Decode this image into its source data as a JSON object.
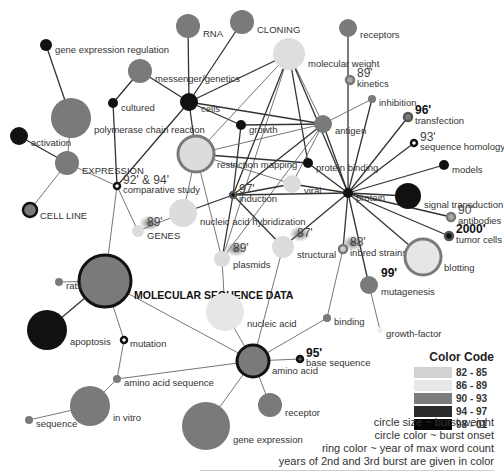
{
  "legend": {
    "title": "Color Code",
    "ranges": [
      {
        "label": "82 - 85",
        "color": "#d2d2d2"
      },
      {
        "label": "86 - 89",
        "color": "#e8e8e8"
      },
      {
        "label": "90 - 93",
        "color": "#7c7c7c"
      },
      {
        "label": "94 - 97",
        "color": "#2a2a2a"
      },
      {
        "label": "98 - 01",
        "color": "#050505"
      }
    ],
    "notes": [
      "circle size ~ burst weight",
      "circle color ~ burst onset",
      "ring color ~ year of max word count",
      "years of 2nd and 3rd burst are given in color"
    ]
  },
  "nodes": [
    {
      "id": "gene-expression-regulation",
      "label": "gene expression regulation",
      "x": 46,
      "y": 45,
      "r": 6,
      "fill": "#111"
    },
    {
      "id": "rna",
      "label": "RNA",
      "x": 188,
      "y": 26,
      "r": 12,
      "fill": "#7a7a7a"
    },
    {
      "id": "cloning",
      "label": "CLONING",
      "x": 242,
      "y": 22,
      "r": 12,
      "fill": "#7a7a7a"
    },
    {
      "id": "receptors",
      "label": "receptors",
      "x": 348,
      "y": 28,
      "r": 9,
      "fill": "#7a7a7a"
    },
    {
      "id": "molecular-weight",
      "label": "molecular weight",
      "x": 289,
      "y": 54,
      "r": 16,
      "fill": "#dedede"
    },
    {
      "id": "messenger-genetics",
      "label": "messenger/genetics",
      "x": 140,
      "y": 71,
      "r": 12,
      "fill": "#7a7a7a"
    },
    {
      "id": "kinetics",
      "label": "kinetics",
      "x": 350,
      "y": 80,
      "r": 4,
      "fill": "#aaa",
      "ring": "#777",
      "year": "89'"
    },
    {
      "id": "cultured",
      "label": "cultured",
      "x": 113,
      "y": 103,
      "r": 5,
      "fill": "#111"
    },
    {
      "id": "cells",
      "label": "cells",
      "x": 189,
      "y": 102,
      "r": 9,
      "fill": "#111"
    },
    {
      "id": "polymerase-chain-reaction",
      "label": "polymerase chain reaction",
      "x": 71,
      "y": 118,
      "r": 20,
      "fill": "#7a7a7a"
    },
    {
      "id": "inhibition",
      "label": "inhibition",
      "x": 372,
      "y": 99,
      "r": 4,
      "fill": "#7a7a7a"
    },
    {
      "id": "growth",
      "label": "growth",
      "x": 241,
      "y": 125,
      "r": 5,
      "fill": "#111"
    },
    {
      "id": "antigen",
      "label": "antigen",
      "x": 323,
      "y": 124,
      "r": 9,
      "fill": "#7a7a7a"
    },
    {
      "id": "activation",
      "label": "activation",
      "x": 19,
      "y": 136,
      "r": 9,
      "fill": "#111"
    },
    {
      "id": "transfection",
      "label": "transfection",
      "x": 408,
      "y": 117,
      "r": 4,
      "fill": "#7a7a7a",
      "ring": "#555",
      "year": "96'",
      "yearBold": true
    },
    {
      "id": "expression",
      "label": "EXPRESSION",
      "x": 67,
      "y": 163,
      "r": 12,
      "fill": "#7a7a7a"
    },
    {
      "id": "restriction-mapping",
      "label": "restriction mapping",
      "x": 196,
      "y": 154,
      "r": 18,
      "fill": "#dcdcdc",
      "ring": "#7a7a7a"
    },
    {
      "id": "sequence-homology",
      "label": "sequence homology",
      "x": 414,
      "y": 143,
      "r": 3,
      "fill": "#fff",
      "ring": "#111",
      "year": "93'"
    },
    {
      "id": "protein-binding",
      "label": "protein binding",
      "x": 308,
      "y": 163,
      "r": 5,
      "fill": "#111"
    },
    {
      "id": "comparative-study",
      "label": "comparative study",
      "x": 117,
      "y": 186,
      "r": 3,
      "fill": "#fff",
      "ring": "#111",
      "year": "92' & 94'"
    },
    {
      "id": "viral",
      "label": "viral",
      "x": 292,
      "y": 184,
      "r": 9,
      "fill": "#dcdcdc"
    },
    {
      "id": "models",
      "label": "models",
      "x": 444,
      "y": 165,
      "r": 5,
      "fill": "#111"
    },
    {
      "id": "induction",
      "label": "induction",
      "x": 233,
      "y": 195,
      "r": 3,
      "fill": "#111",
      "ring": "#555",
      "year": "97'"
    },
    {
      "id": "protein",
      "label": "protein",
      "x": 348,
      "y": 193,
      "r": 5,
      "fill": "#111"
    },
    {
      "id": "signal-transduction",
      "label": "signal transduction",
      "x": 408,
      "y": 196,
      "r": 13,
      "fill": "#111"
    },
    {
      "id": "cell-line",
      "label": "CELL LINE",
      "x": 30,
      "y": 210,
      "r": 7,
      "fill": "#7a7a7a",
      "ring": "#111"
    },
    {
      "id": "nucleic-acid-hybridization",
      "label": "nucleic acid hybridization",
      "x": 183,
      "y": 213,
      "r": 14,
      "fill": "#dcdcdc"
    },
    {
      "id": "antibodies",
      "label": "antibodies",
      "x": 451,
      "y": 217,
      "r": 4,
      "fill": "#aaa",
      "ring": "#777",
      "year": "90'"
    },
    {
      "id": "genes",
      "label": "GENES",
      "x": 138,
      "y": 231,
      "r": 6,
      "fill": "#dcdcdc",
      "year": "89'",
      "glow": true
    },
    {
      "id": "tumor-cells",
      "label": "tumor cells",
      "x": 449,
      "y": 236,
      "r": 4,
      "fill": "#111",
      "ring": "#555",
      "year": "2000'",
      "yearBold": true
    },
    {
      "id": "structural",
      "label": "structural",
      "x": 283,
      "y": 247,
      "r": 11,
      "fill": "#dcdcdc",
      "year": "87'",
      "glow": true
    },
    {
      "id": "inbred-strains",
      "label": "inbred strains",
      "x": 343,
      "y": 249,
      "r": 4,
      "fill": "#ccc",
      "ring": "#777",
      "year": "88'",
      "glow": true
    },
    {
      "id": "blotting",
      "label": "blotting",
      "x": 423,
      "y": 257,
      "r": 18,
      "fill": "#e6e6e6",
      "ring": "#7a7a7a"
    },
    {
      "id": "plasmids",
      "label": "plasmids",
      "x": 222,
      "y": 259,
      "r": 8,
      "fill": "#dcdcdc",
      "year": "89'",
      "glow": true
    },
    {
      "id": "molecular-sequence-data",
      "label": "MOLECULAR SEQUENCE DATA",
      "x": 105,
      "y": 281,
      "r": 26,
      "fill": "#7a7a7a",
      "ring": "#111"
    },
    {
      "id": "rats",
      "label": "rats",
      "x": 59,
      "y": 282,
      "r": 4,
      "fill": "#7a7a7a"
    },
    {
      "id": "mutagenesis",
      "label": "mutagenesis",
      "x": 369,
      "y": 285,
      "r": 9,
      "fill": "#7a7a7a",
      "year": "99'",
      "yearBold": true
    },
    {
      "id": "nucleic-acid",
      "label": "nucleic acid",
      "x": 225,
      "y": 312,
      "r": 19,
      "fill": "#e6e6e6"
    },
    {
      "id": "apoptosis",
      "label": "apoptosis",
      "x": 47,
      "y": 330,
      "r": 20,
      "fill": "#111"
    },
    {
      "id": "binding",
      "label": "binding",
      "x": 327,
      "y": 318,
      "r": 4,
      "fill": "#7a7a7a"
    },
    {
      "id": "mutation",
      "label": "mutation",
      "x": 124,
      "y": 340,
      "r": 3,
      "fill": "#fff",
      "ring": "#111"
    },
    {
      "id": "growth-factor",
      "label": "growth-factor",
      "x": 380,
      "y": 330,
      "r": 3,
      "fill": "#eee"
    },
    {
      "id": "amino-acid",
      "label": "amino acid",
      "x": 253,
      "y": 361,
      "r": 16,
      "fill": "#7a7a7a",
      "ring": "#111"
    },
    {
      "id": "base-sequence",
      "label": "base sequence",
      "x": 300,
      "y": 359,
      "r": 3,
      "fill": "#555",
      "ring": "#111",
      "year": "95'",
      "yearBold": true
    },
    {
      "id": "amino-acid-sequence",
      "label": "amino acid sequence",
      "x": 117,
      "y": 379,
      "r": 4,
      "fill": "#7a7a7a"
    },
    {
      "id": "in-vitro",
      "label": "in vitro",
      "x": 90,
      "y": 406,
      "r": 20,
      "fill": "#7a7a7a"
    },
    {
      "id": "receptor",
      "label": "receptor",
      "x": 270,
      "y": 405,
      "r": 12,
      "fill": "#7a7a7a"
    },
    {
      "id": "sequence",
      "label": "sequence",
      "x": 29,
      "y": 420,
      "r": 4,
      "fill": "#7a7a7a"
    },
    {
      "id": "gene-expression",
      "label": "gene expression",
      "x": 206,
      "y": 426,
      "r": 24,
      "fill": "#7a7a7a"
    }
  ],
  "edges": [
    [
      "gene-expression-regulation",
      "polymerase-chain-reaction"
    ],
    [
      "polymerase-chain-reaction",
      "expression"
    ],
    [
      "activation",
      "expression"
    ],
    [
      "expression",
      "cell-line"
    ],
    [
      "expression",
      "comparative-study"
    ],
    [
      "rna",
      "cells"
    ],
    [
      "cloning",
      "cells"
    ],
    [
      "messenger-genetics",
      "cells"
    ],
    [
      "cultured",
      "messenger-genetics"
    ],
    [
      "cultured",
      "comparative-study"
    ],
    [
      "comparative-study",
      "cells"
    ],
    [
      "comparative-study",
      "genes"
    ],
    [
      "comparative-study",
      "molecular-sequence-data"
    ],
    [
      "cells",
      "molecular-weight"
    ],
    [
      "cells",
      "growth"
    ],
    [
      "cells",
      "antigen"
    ],
    [
      "cells",
      "restriction-mapping"
    ],
    [
      "molecular-weight",
      "restriction-mapping"
    ],
    [
      "molecular-weight",
      "induction"
    ],
    [
      "molecular-weight",
      "plasmids"
    ],
    [
      "molecular-weight",
      "antigen"
    ],
    [
      "molecular-weight",
      "protein"
    ],
    [
      "molecular-weight",
      "protein-binding"
    ],
    [
      "receptors",
      "protein"
    ],
    [
      "inhibition",
      "antigen"
    ],
    [
      "inhibition",
      "protein"
    ],
    [
      "growth",
      "antigen"
    ],
    [
      "growth",
      "induction"
    ],
    [
      "restriction-mapping",
      "antigen"
    ],
    [
      "restriction-mapping",
      "protein-binding"
    ],
    [
      "restriction-mapping",
      "viral"
    ],
    [
      "restriction-mapping",
      "plasmids"
    ],
    [
      "restriction-mapping",
      "nucleic-acid-hybridization"
    ],
    [
      "antigen",
      "protein"
    ],
    [
      "antigen",
      "induction"
    ],
    [
      "antigen",
      "plasmids"
    ],
    [
      "antigen",
      "viral"
    ],
    [
      "protein-binding",
      "protein"
    ],
    [
      "viral",
      "protein"
    ],
    [
      "viral",
      "induction"
    ],
    [
      "induction",
      "protein"
    ],
    [
      "induction",
      "plasmids"
    ],
    [
      "induction",
      "structural"
    ],
    [
      "induction",
      "nucleic-acid-hybridization"
    ],
    [
      "protein",
      "transfection"
    ],
    [
      "protein",
      "sequence-homology"
    ],
    [
      "protein",
      "models"
    ],
    [
      "protein",
      "signal-transduction"
    ],
    [
      "protein",
      "antibodies"
    ],
    [
      "protein",
      "tumor-cells"
    ],
    [
      "protein",
      "blotting"
    ],
    [
      "protein",
      "inbred-strains"
    ],
    [
      "protein",
      "structural"
    ],
    [
      "protein",
      "mutagenesis"
    ],
    [
      "inbred-strains",
      "binding"
    ],
    [
      "genes",
      "nucleic-acid-hybridization"
    ],
    [
      "plasmids",
      "nucleic-acid"
    ],
    [
      "structural",
      "amino-acid"
    ],
    [
      "molecular-sequence-data",
      "rats"
    ],
    [
      "molecular-sequence-data",
      "apoptosis"
    ],
    [
      "molecular-sequence-data",
      "mutation"
    ],
    [
      "molecular-sequence-data",
      "amino-acid"
    ],
    [
      "nucleic-acid",
      "amino-acid"
    ],
    [
      "mutagenesis",
      "growth-factor"
    ],
    [
      "mutation",
      "amino-acid-sequence"
    ],
    [
      "amino-acid",
      "binding"
    ],
    [
      "amino-acid",
      "base-sequence"
    ],
    [
      "amino-acid",
      "amino-acid-sequence"
    ],
    [
      "amino-acid",
      "receptor"
    ],
    [
      "amino-acid",
      "gene-expression"
    ],
    [
      "amino-acid-sequence",
      "in-vitro"
    ],
    [
      "in-vitro",
      "sequence"
    ]
  ]
}
